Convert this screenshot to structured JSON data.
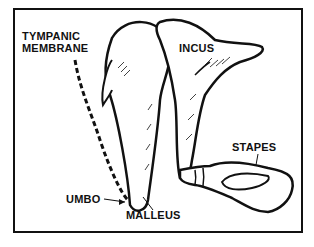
{
  "diagram": {
    "labels": {
      "tympanic_line1": "TYMPANIC",
      "tympanic_line2": "MEMBRANE",
      "incus": "INCUS",
      "stapes": "STAPES",
      "umbo": "UMBO",
      "malleus": "MALLEUS"
    },
    "colors": {
      "ink": "#111111",
      "background": "#ffffff"
    }
  }
}
